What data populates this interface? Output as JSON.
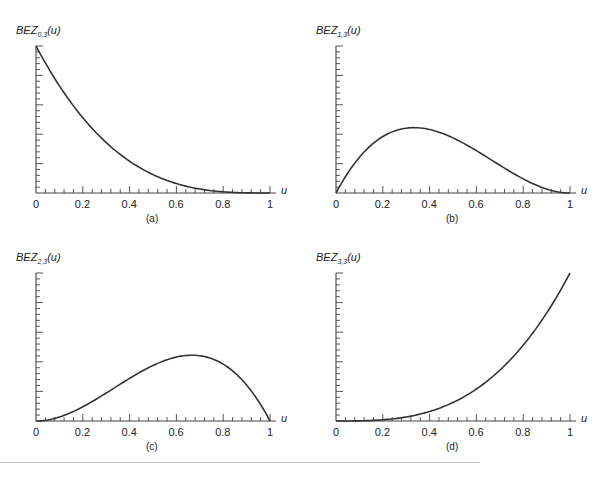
{
  "chart_data": [
    {
      "type": "line",
      "id": "a",
      "caption": "(a)",
      "ylabel_base": "BEZ",
      "ylabel_sub": "0,3",
      "ylabel_arg": "(u)",
      "xlabel": "u",
      "x_ticks": [
        "0",
        "0.2",
        "0.4",
        "0.6",
        "0.8",
        "1"
      ],
      "y_ticks": [
        "0.2",
        "0.4",
        "0.6",
        "0.8",
        "1"
      ],
      "xlim": [
        0,
        1
      ],
      "ylim": [
        0,
        1
      ],
      "x": [
        0,
        0.1,
        0.2,
        0.3,
        0.4,
        0.5,
        0.6,
        0.7,
        0.8,
        0.9,
        1.0
      ],
      "values": [
        1.0,
        0.729,
        0.512,
        0.343,
        0.216,
        0.125,
        0.064,
        0.027,
        0.008,
        0.001,
        0.0
      ]
    },
    {
      "type": "line",
      "id": "b",
      "caption": "(b)",
      "ylabel_base": "BEZ",
      "ylabel_sub": "1,3",
      "ylabel_arg": "(u)",
      "xlabel": "u",
      "x_ticks": [
        "0",
        "0.2",
        "0.4",
        "0.6",
        "0.8",
        "1"
      ],
      "y_ticks": [
        "0.2",
        "0.4",
        "0.6",
        "0.8",
        "1"
      ],
      "xlim": [
        0,
        1
      ],
      "ylim": [
        0,
        1
      ],
      "x": [
        0,
        0.1,
        0.2,
        0.3,
        0.4,
        0.5,
        0.6,
        0.7,
        0.8,
        0.9,
        1.0
      ],
      "values": [
        0.0,
        0.243,
        0.384,
        0.441,
        0.432,
        0.375,
        0.288,
        0.189,
        0.096,
        0.027,
        0.0
      ]
    },
    {
      "type": "line",
      "id": "c",
      "caption": "(c)",
      "ylabel_base": "BEZ",
      "ylabel_sub": "2,3",
      "ylabel_arg": "(u)",
      "xlabel": "u",
      "x_ticks": [
        "0",
        "0.2",
        "0.4",
        "0.6",
        "0.8",
        "1"
      ],
      "y_ticks": [
        "0.2",
        "0.4",
        "0.6",
        "0.8",
        "1"
      ],
      "xlim": [
        0,
        1
      ],
      "ylim": [
        0,
        1
      ],
      "x": [
        0,
        0.1,
        0.2,
        0.3,
        0.4,
        0.5,
        0.6,
        0.7,
        0.8,
        0.9,
        1.0
      ],
      "values": [
        0.0,
        0.027,
        0.096,
        0.189,
        0.288,
        0.375,
        0.432,
        0.441,
        0.384,
        0.243,
        0.0
      ]
    },
    {
      "type": "line",
      "id": "d",
      "caption": "(d)",
      "ylabel_base": "BEZ",
      "ylabel_sub": "3,3",
      "ylabel_arg": "(u)",
      "xlabel": "u",
      "x_ticks": [
        "0",
        "0.2",
        "0.4",
        "0.6",
        "0.8",
        "1"
      ],
      "y_ticks": [
        "0.2",
        "0.4",
        "0.6",
        "0.8",
        "1"
      ],
      "xlim": [
        0,
        1
      ],
      "ylim": [
        0,
        1
      ],
      "x": [
        0,
        0.1,
        0.2,
        0.3,
        0.4,
        0.5,
        0.6,
        0.7,
        0.8,
        0.9,
        1.0
      ],
      "values": [
        0.0,
        0.001,
        0.008,
        0.027,
        0.064,
        0.125,
        0.216,
        0.343,
        0.512,
        0.729,
        1.0
      ]
    }
  ],
  "colors": {
    "curve": "#333333",
    "axis": "#444444",
    "separator": "#bdbdbd"
  }
}
